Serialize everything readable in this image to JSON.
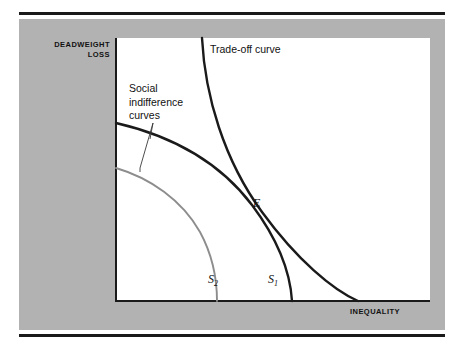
{
  "figure": {
    "type": "economics-tradeoff-diagram",
    "background": "#ffffff",
    "panel_color": "#b2b2b2",
    "plot_background": "#ffffff",
    "rule_color": "#1a1a1a"
  },
  "axes": {
    "y_label": "DEADWEIGHT LOSS",
    "x_label": "INEQUALITY",
    "axis_color": "#1a1a1a"
  },
  "annotations": {
    "tradeoff": "Trade-off curve",
    "social_indifference": "Social indifference curves",
    "equilibrium_point": "E"
  },
  "curves": {
    "s1_label": "S",
    "s1_sub": "1",
    "s2_label": "S",
    "s2_sub": "2"
  },
  "chart_data": {
    "type": "line",
    "xlabel": "INEQUALITY",
    "ylabel": "DEADWEIGHT LOSS",
    "grid": false,
    "legend": "inline-labels",
    "xlim": [
      0,
      1
    ],
    "ylim": [
      0,
      1
    ],
    "annotations": [
      {
        "text": "Trade-off curve",
        "x": 0.3,
        "y": 0.97
      },
      {
        "text": "Social indifference curves",
        "x": 0.05,
        "y": 0.82
      },
      {
        "text": "E",
        "x": 0.44,
        "y": 0.4,
        "role": "tangency-point"
      }
    ],
    "series": [
      {
        "name": "Trade-off curve",
        "color": "#1a1a1a",
        "width": 2.4,
        "points": [
          [
            0.277,
            1.0
          ],
          [
            0.283,
            0.93
          ],
          [
            0.293,
            0.86
          ],
          [
            0.307,
            0.79
          ],
          [
            0.325,
            0.718
          ],
          [
            0.348,
            0.645
          ],
          [
            0.375,
            0.575
          ],
          [
            0.405,
            0.505
          ],
          [
            0.437,
            0.44
          ],
          [
            0.47,
            0.382
          ],
          [
            0.51,
            0.325
          ],
          [
            0.556,
            0.268
          ],
          [
            0.61,
            0.21
          ],
          [
            0.67,
            0.152
          ],
          [
            0.7,
            0.122
          ],
          [
            0.772,
            0.048
          ],
          [
            0.772,
            0.0
          ]
        ]
      },
      {
        "name": "S1",
        "color": "#1a1a1a",
        "width": 2.4,
        "points": [
          [
            0.0,
            0.678
          ],
          [
            0.05,
            0.66
          ],
          [
            0.105,
            0.636
          ],
          [
            0.16,
            0.608
          ],
          [
            0.215,
            0.576
          ],
          [
            0.272,
            0.54
          ],
          [
            0.33,
            0.5
          ],
          [
            0.385,
            0.458
          ],
          [
            0.43,
            0.418
          ],
          [
            0.47,
            0.377
          ],
          [
            0.5,
            0.34
          ],
          [
            0.525,
            0.3
          ],
          [
            0.545,
            0.25
          ],
          [
            0.558,
            0.19
          ],
          [
            0.566,
            0.12
          ],
          [
            0.568,
            0.05
          ],
          [
            0.568,
            0.0
          ]
        ]
      },
      {
        "name": "S2",
        "color": "#8d8d8d",
        "width": 1.8,
        "points": [
          [
            0.0,
            0.508
          ],
          [
            0.043,
            0.492
          ],
          [
            0.09,
            0.47
          ],
          [
            0.14,
            0.44
          ],
          [
            0.19,
            0.404
          ],
          [
            0.235,
            0.362
          ],
          [
            0.272,
            0.316
          ],
          [
            0.3,
            0.266
          ],
          [
            0.318,
            0.212
          ],
          [
            0.33,
            0.152
          ],
          [
            0.336,
            0.085
          ],
          [
            0.338,
            0.03
          ],
          [
            0.338,
            0.0
          ]
        ]
      },
      {
        "name": "pointer-bracket",
        "color": "#3a3a3a",
        "width": 0.9,
        "role": "annotation-leader",
        "points": [
          [
            0.079,
            0.415
          ],
          [
            0.079,
            0.432
          ],
          [
            0.121,
            0.678
          ],
          [
            0.115,
            0.616
          ]
        ]
      }
    ]
  }
}
